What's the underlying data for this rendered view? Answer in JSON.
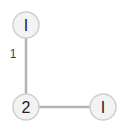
{
  "diagram": {
    "type": "graph",
    "nodes": [
      {
        "id": "top",
        "label": "I",
        "x": 26,
        "y": 25
      },
      {
        "id": "mid",
        "label": "2",
        "x": 26,
        "y": 107
      },
      {
        "id": "right",
        "label": "I",
        "x": 103,
        "y": 107
      }
    ],
    "edges": [
      {
        "from": "top",
        "to": "mid",
        "label": "1"
      },
      {
        "from": "mid",
        "to": "right",
        "label": ""
      }
    ],
    "colors": {
      "node_fill": "#f3f3f3",
      "node_stroke": "#cfcfcf",
      "edge": "#b3b3b3",
      "text": "#222222"
    }
  }
}
